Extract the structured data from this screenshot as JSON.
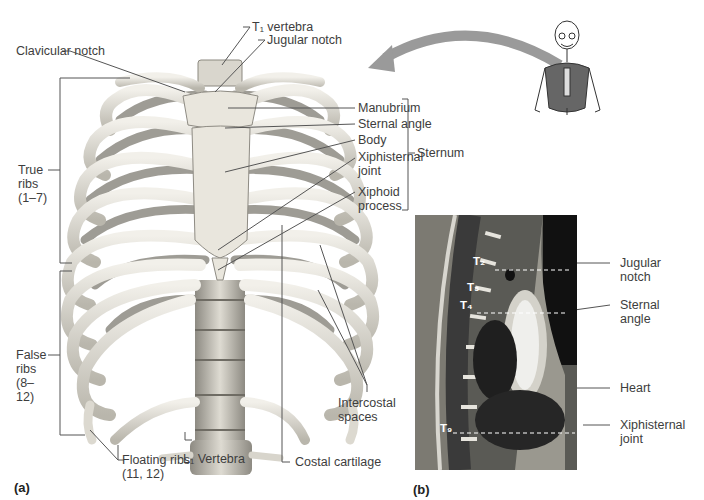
{
  "figure": {
    "panel_a_label": "(a)",
    "panel_b_label": "(b)"
  },
  "panel_a": {
    "labels": {
      "t1_vertebra": "T₁ vertebra",
      "jugular_notch": "Jugular notch",
      "clavicular_notch": "Clavicular notch",
      "manubrium": "Manubrium",
      "sternal_angle": "Sternal angle",
      "body": "Body",
      "xiphisternal_joint": "Xiphisternal joint",
      "xiphoid_process": "Xiphoid process",
      "sternum": "Sternum",
      "true_ribs": "True ribs (1–7)",
      "false_ribs": "False ribs (8–12)",
      "floating_ribs": "Floating ribs (11, 12)",
      "l1_vertebra": "L₁ Vertebra",
      "costal_cartilage": "Costal cartilage",
      "intercostal_spaces": "Intercostal spaces"
    }
  },
  "panel_b": {
    "vertebra_markers": [
      "T₂",
      "T₃",
      "T₄",
      "T₉"
    ],
    "labels": {
      "jugular_notch": "Jugular notch",
      "sternal_angle": "Sternal angle",
      "heart": "Heart",
      "xiphisternal_joint": "Xiphisternal joint"
    }
  },
  "colors": {
    "bone": "#e6e4dc",
    "bone_shadow": "#a9a69c",
    "leader_line": "#555555",
    "arrow": "#999999",
    "mri_dark": "#2e2e2e"
  }
}
